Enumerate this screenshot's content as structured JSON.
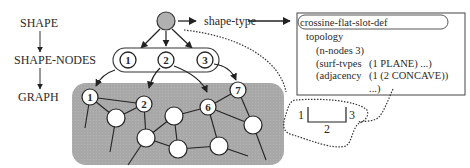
{
  "hierarchy": {
    "levels": [
      "SHAPE",
      "SHAPE-NODES",
      "GRAPH"
    ]
  },
  "root_node": {
    "label": "shape-type",
    "color": "#b0b0b0"
  },
  "shape_nodes": [
    "1",
    "2",
    "3"
  ],
  "graph": {
    "background": "#a9a9a9",
    "labeled_nodes": [
      "1",
      "2",
      "6",
      "7"
    ]
  },
  "frame": {
    "title": "crossine-flat-slot-def",
    "lines": [
      {
        "key": "topology",
        "value": ""
      },
      {
        "key": "(n-nodes 3)",
        "value": ""
      },
      {
        "key": "(surf-tvpes",
        "value": "(1 PLANE) ...)"
      },
      {
        "key": "(adjacency",
        "value": "(1 (2 CONCAVE))"
      },
      {
        "key": "",
        "value": "...)"
      }
    ]
  },
  "profile_sketch": {
    "labels": [
      "1",
      "2",
      "3"
    ]
  }
}
